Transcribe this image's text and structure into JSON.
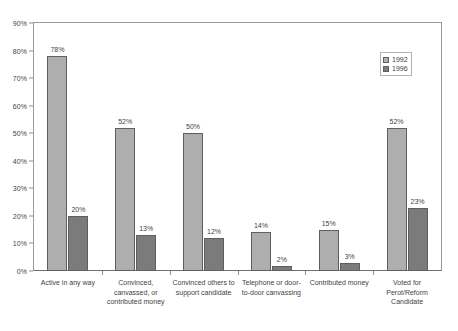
{
  "chart_data": {
    "type": "bar",
    "title": "",
    "xlabel": "",
    "ylabel": "",
    "ylim": [
      0,
      90
    ],
    "ytick_labels": [
      "0%",
      "10%",
      "20%",
      "30%",
      "40%",
      "50%",
      "60%",
      "70%",
      "80%",
      "90%"
    ],
    "ytick_values": [
      0,
      10,
      20,
      30,
      40,
      50,
      60,
      70,
      80,
      90
    ],
    "grid": false,
    "legend_position": "upper-right-inside",
    "categories": [
      "Active in any way",
      "Convinced, canvassed, or contributed money",
      "Convinced others to support candidate",
      "Telephone or door-to-door canvassing",
      "Contributed money",
      "Voted for Perot/Reform Candidate"
    ],
    "category_lines": [
      [
        "Active in any way"
      ],
      [
        "Convinced,",
        "canvassed, or",
        "contributed money"
      ],
      [
        "Convinced others to",
        "support candidate"
      ],
      [
        "Telephone or door-",
        "to-door canvassing"
      ],
      [
        "Contributed money"
      ],
      [
        "Voted for",
        "Perot/Reform",
        "Candidate"
      ]
    ],
    "series": [
      {
        "name": "1992",
        "color": "#aeaeae",
        "values": [
          78,
          52,
          50,
          14,
          15,
          52
        ],
        "labels": [
          "78%",
          "52%",
          "50%",
          "14%",
          "15%",
          "52%"
        ]
      },
      {
        "name": "1996",
        "color": "#7b7b7b",
        "values": [
          20,
          13,
          12,
          2,
          3,
          23
        ],
        "labels": [
          "20%",
          "13%",
          "12%",
          "2%",
          "3%",
          "23%"
        ]
      }
    ]
  },
  "legend": {
    "entries": [
      {
        "label": "1992"
      },
      {
        "label": "1996"
      }
    ]
  }
}
